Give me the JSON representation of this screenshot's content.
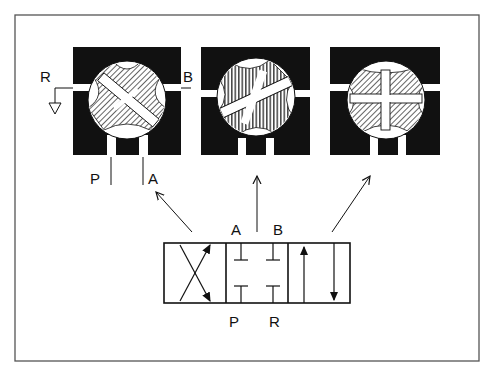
{
  "figure": {
    "frame_color": "#555555",
    "ink_color": "#111111",
    "background": "#ffffff"
  },
  "valve_sections": [
    {
      "id": "position-cross",
      "description": "Crossed flow: P to B, A to R",
      "hatch": "diagonal"
    },
    {
      "id": "position-closed",
      "description": "Center closed: all ports blocked",
      "hatch": "vertical"
    },
    {
      "id": "position-parallel",
      "description": "Parallel flow: P to A, B to R",
      "hatch": "diagonal"
    }
  ],
  "port_labels": {
    "section_r": "R",
    "section_b": "B",
    "section_p": "P",
    "section_a": "A"
  },
  "symbol": {
    "label_a": "A",
    "label_b": "B",
    "label_p": "P",
    "label_r": "R",
    "envelopes": [
      "crossed",
      "closed",
      "parallel"
    ]
  }
}
